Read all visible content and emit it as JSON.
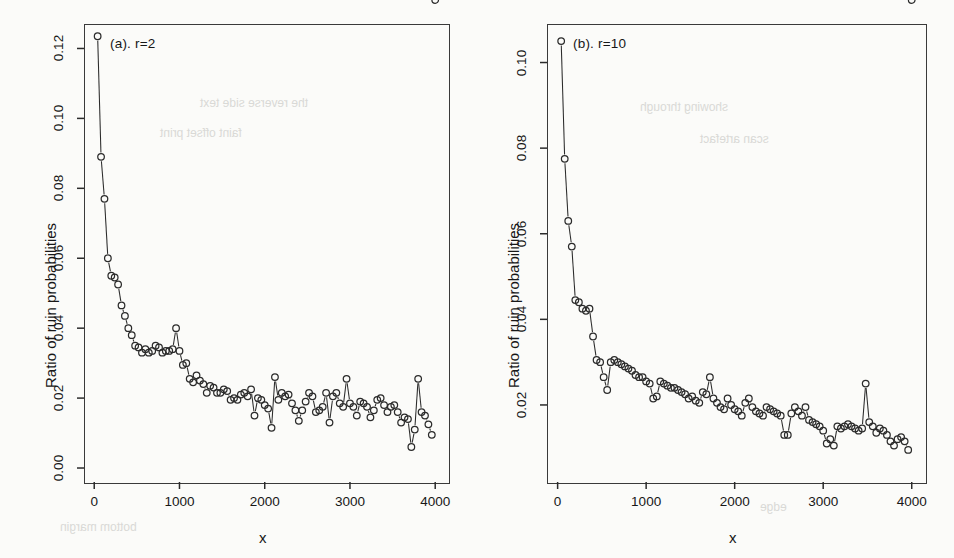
{
  "figure": {
    "background": "#fbfbf9",
    "ink": "#2b2b2b",
    "panel_count": 2
  },
  "chart_data": [
    {
      "type": "scatter",
      "id": "panel-a",
      "title": "(a).  r=2",
      "xlabel": "x",
      "ylabel": "Ratio of ruin probabilities",
      "xlim": [
        -120,
        4150
      ],
      "ylim": [
        -0.004,
        0.127
      ],
      "xticks": [
        0,
        1000,
        2000,
        3000,
        4000
      ],
      "yticks": [
        0.0,
        0.02,
        0.04,
        0.06,
        0.08,
        0.1,
        0.12
      ],
      "xticklabels": [
        "0",
        "1000",
        "2000",
        "3000",
        "4000"
      ],
      "yticklabels": [
        "0.00",
        "0.02",
        "0.04",
        "0.06",
        "0.08",
        "0.10",
        "0.12"
      ],
      "grid": false,
      "legend": "none",
      "marker": "open-circle",
      "line": "thin-connecting",
      "x": [
        40,
        80,
        120,
        160,
        200,
        240,
        280,
        320,
        360,
        400,
        440,
        480,
        520,
        560,
        600,
        640,
        680,
        720,
        760,
        800,
        840,
        880,
        920,
        960,
        1000,
        1040,
        1080,
        1120,
        1160,
        1200,
        1240,
        1280,
        1320,
        1360,
        1400,
        1440,
        1480,
        1520,
        1560,
        1600,
        1640,
        1680,
        1720,
        1760,
        1800,
        1840,
        1880,
        1920,
        1960,
        2000,
        2040,
        2080,
        2120,
        2160,
        2200,
        2240,
        2280,
        2320,
        2360,
        2400,
        2440,
        2480,
        2520,
        2560,
        2600,
        2640,
        2680,
        2720,
        2760,
        2800,
        2840,
        2880,
        2920,
        2960,
        3000,
        3040,
        3080,
        3120,
        3160,
        3200,
        3240,
        3280,
        3320,
        3360,
        3400,
        3440,
        3480,
        3520,
        3560,
        3600,
        3640,
        3680,
        3720,
        3760,
        3800,
        3840,
        3880,
        3920,
        3960,
        4000
      ],
      "y": [
        0.1235,
        0.089,
        0.077,
        0.06,
        0.055,
        0.0545,
        0.0525,
        0.0465,
        0.0435,
        0.04,
        0.038,
        0.035,
        0.0345,
        0.033,
        0.034,
        0.033,
        0.0335,
        0.035,
        0.0345,
        0.033,
        0.0335,
        0.0335,
        0.034,
        0.04,
        0.0335,
        0.0295,
        0.03,
        0.0255,
        0.0245,
        0.0265,
        0.025,
        0.024,
        0.0215,
        0.0235,
        0.023,
        0.0215,
        0.0215,
        0.0225,
        0.022,
        0.0195,
        0.02,
        0.0195,
        0.021,
        0.0215,
        0.0205,
        0.0225,
        0.015,
        0.02,
        0.0195,
        0.018,
        0.017,
        0.0115,
        0.026,
        0.0195,
        0.0215,
        0.0205,
        0.021,
        0.0185,
        0.0165,
        0.0135,
        0.0165,
        0.019,
        0.0215,
        0.0205,
        0.016,
        0.0165,
        0.0175,
        0.0215,
        0.013,
        0.0205,
        0.0215,
        0.0185,
        0.0175,
        0.0255,
        0.0185,
        0.0175,
        0.015,
        0.019,
        0.0185,
        0.0175,
        0.0145,
        0.0165,
        0.0195,
        0.02,
        0.018,
        0.016,
        0.0175,
        0.018,
        0.016,
        0.013,
        0.0145,
        0.014,
        0.006,
        0.011,
        0.0255,
        0.016,
        0.015,
        0.0125,
        0.0095
      ]
    },
    {
      "type": "scatter",
      "id": "panel-b",
      "title": "(b).  r=10",
      "xlabel": "x",
      "ylabel": "Ratio of ruin probabilities",
      "xlim": [
        -120,
        4150
      ],
      "ylim": [
        0.002,
        0.109
      ],
      "xticks": [
        0,
        1000,
        2000,
        3000,
        4000
      ],
      "yticks": [
        0.02,
        0.04,
        0.06,
        0.08,
        0.1
      ],
      "xticklabels": [
        "0",
        "1000",
        "2000",
        "3000",
        "4000"
      ],
      "yticklabels": [
        "0.02",
        "0.04",
        "0.06",
        "0.08",
        "0.10"
      ],
      "grid": false,
      "legend": "none",
      "marker": "open-circle",
      "line": "thin-connecting",
      "x": [
        40,
        80,
        120,
        160,
        200,
        240,
        280,
        320,
        360,
        400,
        440,
        480,
        520,
        560,
        600,
        640,
        680,
        720,
        760,
        800,
        840,
        880,
        920,
        960,
        1000,
        1040,
        1080,
        1120,
        1160,
        1200,
        1240,
        1280,
        1320,
        1360,
        1400,
        1440,
        1480,
        1520,
        1560,
        1600,
        1640,
        1680,
        1720,
        1760,
        1800,
        1840,
        1880,
        1920,
        1960,
        2000,
        2040,
        2080,
        2120,
        2160,
        2200,
        2240,
        2280,
        2320,
        2360,
        2400,
        2440,
        2480,
        2520,
        2560,
        2600,
        2640,
        2680,
        2720,
        2760,
        2800,
        2840,
        2880,
        2920,
        2960,
        3000,
        3040,
        3080,
        3120,
        3160,
        3200,
        3240,
        3280,
        3320,
        3360,
        3400,
        3440,
        3480,
        3520,
        3560,
        3600,
        3640,
        3680,
        3720,
        3760,
        3800,
        3840,
        3880,
        3920,
        3960,
        4000
      ],
      "y": [
        0.105,
        0.0775,
        0.063,
        0.057,
        0.0445,
        0.044,
        0.0425,
        0.042,
        0.0425,
        0.036,
        0.0305,
        0.03,
        0.0265,
        0.0235,
        0.03,
        0.0305,
        0.03,
        0.0295,
        0.029,
        0.0285,
        0.028,
        0.027,
        0.0265,
        0.0265,
        0.0255,
        0.025,
        0.0215,
        0.022,
        0.0255,
        0.025,
        0.0245,
        0.024,
        0.024,
        0.0235,
        0.023,
        0.0225,
        0.0215,
        0.022,
        0.021,
        0.0205,
        0.023,
        0.0225,
        0.0265,
        0.0215,
        0.0205,
        0.0195,
        0.019,
        0.0215,
        0.02,
        0.019,
        0.0185,
        0.0175,
        0.0205,
        0.0215,
        0.0195,
        0.0185,
        0.018,
        0.0175,
        0.0195,
        0.019,
        0.0185,
        0.018,
        0.0175,
        0.013,
        0.013,
        0.018,
        0.0195,
        0.0185,
        0.0175,
        0.0195,
        0.0165,
        0.016,
        0.0155,
        0.015,
        0.014,
        0.011,
        0.012,
        0.0105,
        0.015,
        0.0145,
        0.015,
        0.0155,
        0.015,
        0.0145,
        0.014,
        0.0145,
        0.025,
        0.016,
        0.015,
        0.0135,
        0.0145,
        0.014,
        0.013,
        0.0115,
        0.0105,
        0.012,
        0.0125,
        0.0115,
        0.0095
      ]
    }
  ]
}
